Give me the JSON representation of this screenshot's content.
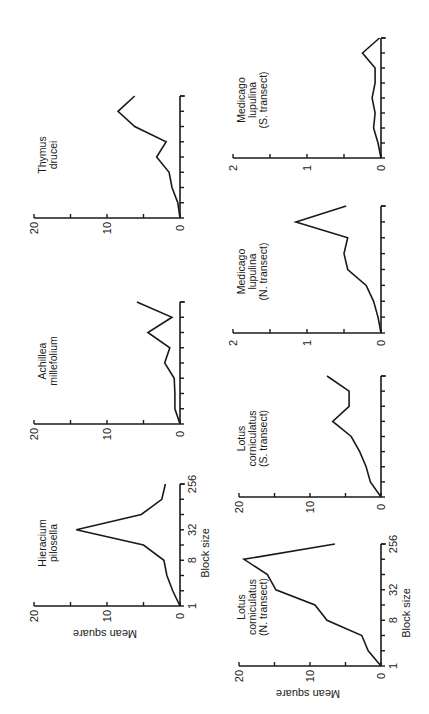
{
  "figure": {
    "orientation": "rotated 90 degrees counter-clockwise",
    "xlabel": "Block size",
    "ylabel": "Mean square"
  },
  "chart_data": [
    {
      "type": "line",
      "title": "Hieracium pilosella",
      "title_lines": [
        "Hieracium",
        "pilosella"
      ],
      "xlabel": "Block size",
      "ylabel": "Mean square",
      "x": [
        1,
        2,
        4,
        8,
        16,
        32,
        64,
        128,
        256
      ],
      "x_tick_labels": [
        "1",
        "8",
        "32",
        "256"
      ],
      "values": [
        0,
        1.0,
        1.8,
        2.2,
        5.0,
        14.2,
        5.3,
        2.5,
        2.0
      ],
      "ylim": [
        0,
        20
      ],
      "y_tick_labels": [
        "0",
        "10",
        "20"
      ],
      "layout": {
        "axisX": 180,
        "yBottom": 606,
        "yTop": 484,
        "ymaxX": 34,
        "panel": "top-row"
      }
    },
    {
      "type": "line",
      "title": "Achillea millefolium",
      "title_lines": [
        "Achillea",
        "millefolium"
      ],
      "xlabel": "",
      "ylabel": "",
      "x": [
        1,
        2,
        4,
        8,
        16,
        32,
        64,
        128,
        256
      ],
      "values": [
        0,
        0.7,
        0.7,
        0.8,
        2.1,
        1.4,
        4.4,
        1.1,
        5.9
      ],
      "ylim": [
        0,
        20
      ],
      "y_tick_labels": [
        "0",
        "10",
        "20"
      ],
      "layout": {
        "axisX": 180,
        "yBottom": 424,
        "yTop": 302,
        "ymaxX": 34,
        "panel": "top-row"
      }
    },
    {
      "type": "line",
      "title": "Thymus drucei",
      "title_lines": [
        "Thymus",
        "drucei"
      ],
      "xlabel": "",
      "ylabel": "",
      "x": [
        1,
        2,
        4,
        8,
        16,
        32,
        64,
        128,
        256
      ],
      "values": [
        0,
        0.3,
        1.1,
        1.5,
        3.2,
        1.9,
        6.2,
        8.5,
        6.2
      ],
      "ylim": [
        0,
        20
      ],
      "y_tick_labels": [
        "0",
        "10",
        "20"
      ],
      "layout": {
        "axisX": 180,
        "yBottom": 218,
        "yTop": 96,
        "ymaxX": 34,
        "panel": "top-row"
      }
    },
    {
      "type": "line",
      "title": "Lotus corniculatus (N. transect)",
      "title_lines": [
        "Lotus",
        "corniculatus",
        "(N. transect)"
      ],
      "xlabel": "Block size",
      "ylabel": "Mean square",
      "x": [
        1,
        2,
        4,
        8,
        16,
        32,
        64,
        128,
        256
      ],
      "x_tick_labels": [
        "1",
        "8",
        "32",
        "256"
      ],
      "values": [
        0,
        1.8,
        2.7,
        7.6,
        9.3,
        14.8,
        16.0,
        19.3,
        6.5
      ],
      "ylim": [
        0,
        20
      ],
      "y_tick_labels": [
        "0",
        "10",
        "20"
      ],
      "layout": {
        "axisX": 381,
        "yBottom": 666,
        "yTop": 544,
        "ymaxX": 239,
        "panel": "bottom-row"
      }
    },
    {
      "type": "line",
      "title": "Lotus corniculatus (S. transect)",
      "title_lines": [
        "Lotus",
        "corniculatus",
        "(S. transect)"
      ],
      "xlabel": "",
      "ylabel": "",
      "x": [
        1,
        2,
        4,
        8,
        16,
        32,
        64,
        128,
        256
      ],
      "values": [
        0,
        1.5,
        2.1,
        3.0,
        4.2,
        6.8,
        4.5,
        4.5,
        7.6
      ],
      "ylim": [
        0,
        20
      ],
      "y_tick_labels": [
        "0",
        "10",
        "20"
      ],
      "layout": {
        "axisX": 381,
        "yBottom": 497,
        "yTop": 376,
        "ymaxX": 239,
        "panel": "bottom-row"
      }
    },
    {
      "type": "line",
      "title": "Medicago lupulina (N. transect)",
      "title_lines": [
        "Medicago",
        "lupulina",
        "(N. transect)"
      ],
      "xlabel": "",
      "ylabel": "",
      "x": [
        1,
        2,
        4,
        8,
        16,
        32,
        64,
        128,
        256
      ],
      "values": [
        0,
        0.04,
        0.1,
        0.2,
        0.45,
        0.5,
        0.45,
        1.15,
        0.47
      ],
      "ylim": [
        0,
        2
      ],
      "y_tick_labels": [
        "0",
        "1",
        "2"
      ],
      "layout": {
        "axisX": 381,
        "yBottom": 333,
        "yTop": 206,
        "ymaxX": 233,
        "panel": "bottom-row"
      }
    },
    {
      "type": "line",
      "title": "Medicago lupulina (S. transect)",
      "title_lines": [
        "Medicago",
        "lupulina",
        "(S. transect)"
      ],
      "xlabel": "",
      "ylabel": "",
      "x": [
        1,
        2,
        4,
        8,
        16,
        32,
        64,
        128,
        256
      ],
      "values": [
        0,
        0.04,
        0.1,
        0.08,
        0.12,
        0.08,
        0.08,
        0.25,
        0.02
      ],
      "ylim": [
        0,
        2
      ],
      "y_tick_labels": [
        "0",
        "1",
        "2"
      ],
      "layout": {
        "axisX": 381,
        "yBottom": 158,
        "yTop": 38,
        "ymaxX": 233,
        "panel": "bottom-row"
      }
    }
  ]
}
